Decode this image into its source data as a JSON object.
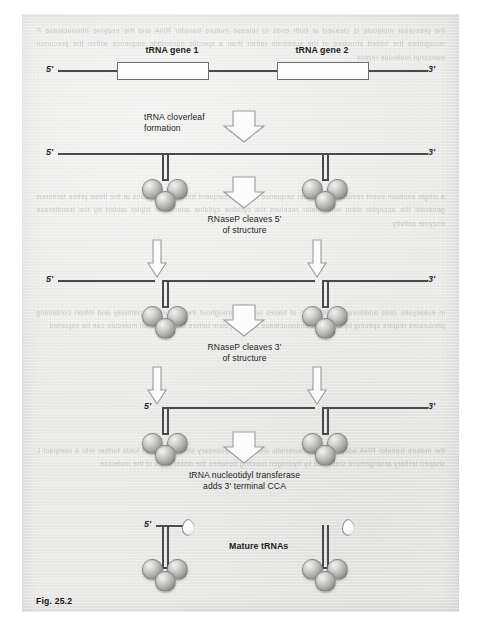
{
  "figure": {
    "caption": "Fig. 25.2",
    "title_topology": "tRNA processing pathway"
  },
  "stage1": {
    "gene1_label": "tRNA gene 1",
    "gene2_label": "tRNA gene 2",
    "five_prime": "5'",
    "three_prime": "3'"
  },
  "step1": {
    "line1": "tRNA cloverleaf",
    "line2": "formation"
  },
  "stage2": {
    "five_prime": "5'",
    "three_prime": "3'"
  },
  "step2": {
    "line1": "RNaseP cleaves 5'",
    "line2": "of structure"
  },
  "stage3": {
    "five_prime": "5'",
    "three_prime": "3'"
  },
  "step3": {
    "line1": "RNaseP cleaves 3'",
    "line2": "of structure"
  },
  "stage4": {
    "five_prime": "5'",
    "three_prime": "3'"
  },
  "step4": {
    "line1": "tRNA nucleotidyl transferase",
    "line2": "adds 3' terminal CCA"
  },
  "stage5": {
    "five_prime": "5'",
    "mature_label": "Mature tRNAs"
  },
  "colors": {
    "paper": "#e9e9e7",
    "ink": "#4a4a4a",
    "text": "#1d1d1d",
    "sphere": "#b0b0ae",
    "arrow_fill": "#fdfdfd",
    "arrow_stroke": "#9a9a98"
  },
  "ghost_text": {
    "block1": "the precursor molecule is cleaved at both ends to release mature transfer RNA and the enzyme ribonuclease P recognises the folded structure of the substrate rather than a specific nucleotide sequence within the precursor transcript molecule region",
    "block2": "a single excision event removes the leader sequence while subsequent trimming reactions at the three prime terminus generate the acceptor stem which later receives the cytidine cytidine adenosine triplet added by the transferase enzyme activity",
    "block3": "in eukaryotic cells additional modification of bases occurs throughout the maturation pathway and intron containing precursors require splicing by a distinct endonuclease ligase system before the functional molecule can be exported",
    "block4": "the mature transfer RNA adopts the characteristic cloverleaf secondary structure which folds further into a compact L shaped tertiary arrangement stabilised by hydrogen bonding between the distal loops of the molecule"
  }
}
